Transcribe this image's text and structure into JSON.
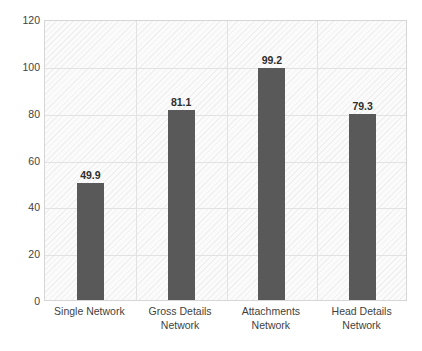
{
  "chart_data": {
    "type": "bar",
    "title": "",
    "subtitle": "",
    "xlabel": "",
    "ylabel": "",
    "categories": [
      "Single Network",
      "Gross Details\nNetwork",
      "Attachments\nNetwork",
      "Head Details\nNetwork"
    ],
    "values": [
      49.9,
      81.1,
      99.2,
      79.3
    ],
    "value_labels": [
      "49.9",
      "81.1",
      "99.2",
      "79.3"
    ],
    "ylim": [
      0,
      120
    ],
    "yticks": [
      0,
      20,
      40,
      60,
      80,
      100,
      120
    ],
    "ytick_labels": [
      "0",
      "20",
      "40",
      "60",
      "80",
      "100",
      "120"
    ],
    "grid": "horizontal-and-vertical",
    "legend": "none",
    "series": [
      {
        "name": "",
        "values": [
          49.9,
          81.1,
          99.2,
          79.3
        ]
      }
    ],
    "colors": {
      "bar": "#595959",
      "plot_background": "#fbfbfb",
      "gridline": "#e2e2e2",
      "plot_border": "#d6d6d6",
      "tick_text": "#3f3f3f",
      "value_text": "#2e2e2e",
      "page_background": "#ffffff"
    }
  }
}
